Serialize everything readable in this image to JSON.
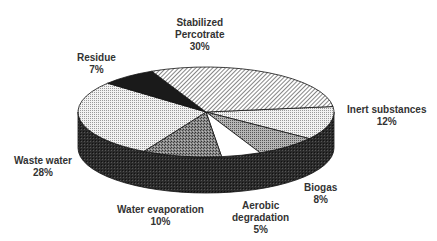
{
  "chart_data": {
    "type": "pie",
    "style": "3d-exploded-none",
    "title": "",
    "categories": [
      "Stabilized Percotrate",
      "Inert substances",
      "Biogas",
      "Aerobic degradation",
      "Water evaporation",
      "Waste water",
      "Residue"
    ],
    "values": [
      30,
      12,
      8,
      5,
      10,
      28,
      7
    ],
    "unit": "%",
    "legend": "none (direct labels)",
    "labels": [
      {
        "line1": "Stabilized",
        "line2": "Percotrate",
        "pct": "30%"
      },
      {
        "line1": "Inert substances",
        "pct": "12%"
      },
      {
        "line1": "Biogas",
        "pct": "8%"
      },
      {
        "line1": "Aerobic",
        "line2": "degradation",
        "pct": "5%"
      },
      {
        "line1": "Water evaporation",
        "pct": "10%"
      },
      {
        "line1": "Waste water",
        "pct": "28%"
      },
      {
        "line1": "Residue",
        "pct": "7%"
      }
    ],
    "fills": [
      "diagonal-hatch",
      "light-dots",
      "mid-gray-dots",
      "white",
      "dark-gray-speckle",
      "light-dots",
      "black"
    ]
  }
}
